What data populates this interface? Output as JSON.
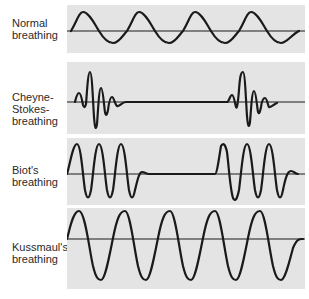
{
  "diagram": {
    "colors": {
      "panel_bg": "#e4e4e4",
      "trace": "#1a1a1a",
      "text": "#2a2a2a"
    },
    "rows": [
      {
        "id": "normal",
        "label_lines": [
          "Normal",
          "breathing"
        ],
        "pattern": "regular sinusoidal breaths, moderate amplitude"
      },
      {
        "id": "cheyne-stokes",
        "label_lines": [
          "Cheyne-",
          "Stokes-",
          "breathing"
        ],
        "pattern": "crescendo-decrescendo bursts separated by apnea"
      },
      {
        "id": "biot",
        "label_lines": [
          "Biot's",
          "breathing"
        ],
        "pattern": "clusters of equal deep breaths separated by apnea"
      },
      {
        "id": "kussmaul",
        "label_lines": [
          "Kussmaul's",
          "breathing"
        ],
        "pattern": "deep, regular, large-amplitude breaths"
      }
    ]
  }
}
